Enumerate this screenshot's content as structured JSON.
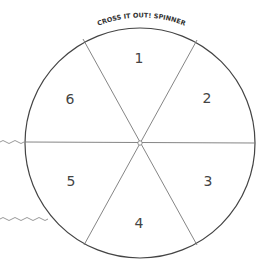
{
  "spinner": {
    "title": "CROSS IT OUT! SPINNER",
    "sections": [
      {
        "label": "1"
      },
      {
        "label": "2"
      },
      {
        "label": "3"
      },
      {
        "label": "4"
      },
      {
        "label": "5"
      },
      {
        "label": "6"
      }
    ],
    "colors": {
      "outline": "#444444",
      "divider": "#777777",
      "text": "#444444",
      "wavy": "#999999"
    }
  }
}
